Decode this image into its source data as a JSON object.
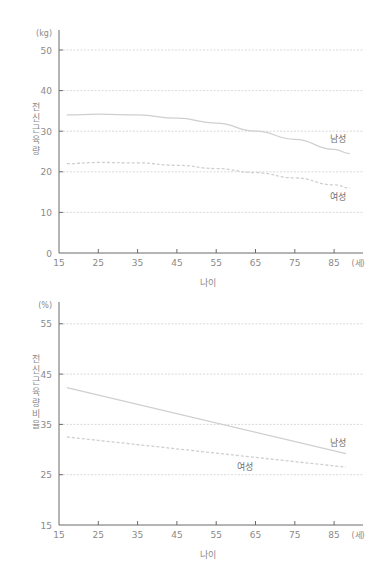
{
  "chart_data": [
    {
      "type": "line",
      "title": "",
      "xlabel": "나이",
      "ylabel": "전신 근육량",
      "y_unit": "(kg)",
      "x_unit": "(세)",
      "x_ticks": [
        15,
        25,
        35,
        45,
        55,
        65,
        75,
        85
      ],
      "y_ticks": [
        0,
        10,
        20,
        30,
        40,
        50
      ],
      "xlim": [
        15,
        92
      ],
      "ylim": [
        0,
        55
      ],
      "grid": "horizontal dotted",
      "series": [
        {
          "name": "남성",
          "style": "solid",
          "x": [
            17,
            25,
            35,
            45,
            55,
            65,
            75,
            85,
            89
          ],
          "values": [
            34.0,
            34.2,
            34.0,
            33.2,
            32.0,
            30.0,
            28.0,
            25.5,
            24.5
          ]
        },
        {
          "name": "여성",
          "style": "dashed",
          "x": [
            17,
            25,
            35,
            45,
            55,
            65,
            75,
            85,
            89
          ],
          "values": [
            22.0,
            22.3,
            22.2,
            21.6,
            20.8,
            19.8,
            18.5,
            16.8,
            16.0
          ]
        }
      ]
    },
    {
      "type": "line",
      "title": "",
      "xlabel": "나이",
      "ylabel": "전신 근육량 비율",
      "y_unit": "(%)",
      "x_unit": "(세)",
      "x_ticks": [
        15,
        25,
        35,
        45,
        55,
        65,
        75,
        85
      ],
      "y_ticks": [
        15,
        25,
        35,
        45,
        55
      ],
      "xlim": [
        15,
        92
      ],
      "ylim": [
        15,
        57
      ],
      "grid": "horizontal dotted",
      "series": [
        {
          "name": "남성",
          "style": "solid",
          "x": [
            17,
            88
          ],
          "values": [
            42.3,
            29.2
          ]
        },
        {
          "name": "여성",
          "style": "dashed",
          "x": [
            17,
            88
          ],
          "values": [
            32.5,
            26.5
          ]
        }
      ]
    }
  ],
  "top": {
    "unit": "(kg)",
    "ytitle": "전신 근육량",
    "xtitle": "나이",
    "xunit": "(세)",
    "label_male": "남성",
    "label_female": "여성"
  },
  "bottom": {
    "unit": "(%)",
    "ytitle": "전신 근육량 비율",
    "xtitle": "나이",
    "xunit": "(세)",
    "label_male": "남성",
    "label_female": "여성"
  },
  "colors": {
    "axis": "#6a6a6a",
    "grid": "#d0d0d0",
    "line": "#cfcfcf",
    "text": "#8a8a8a"
  }
}
